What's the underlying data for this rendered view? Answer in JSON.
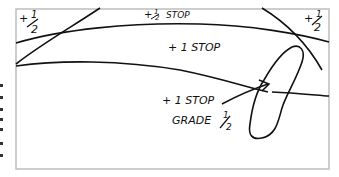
{
  "diagram": {
    "title": "",
    "labels": {
      "top_left_corner": "+ ½",
      "top_right_corner": "+ ½",
      "top_band": "+ ½ STOP",
      "middle_band": "+ 1 STOP",
      "arrow_label": "+ 1 STOP",
      "grade_label": "GRADE ½"
    },
    "label_parts": {
      "top_left_plus": "+",
      "top_left_num": "1",
      "top_left_den": "2",
      "top_right_plus": "+",
      "top_right_num": "1",
      "top_right_den": "2",
      "top_band_prefix": "+",
      "top_band_num": "1",
      "top_band_den": "2",
      "top_band_word": "STOP",
      "middle_band_text": "+ 1 STOP",
      "arrow_label_text": "+ 1 STOP",
      "grade_word": "GRADE",
      "grade_num": "1",
      "grade_den": "2"
    },
    "colors": {
      "ink": "#111111",
      "frame": "#bdbdbd",
      "background": "#ffffff"
    }
  }
}
